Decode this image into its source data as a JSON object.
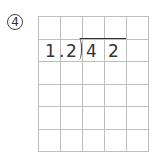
{
  "problem_label": "④",
  "grid": {
    "columns": 5,
    "rows": 6
  },
  "division": {
    "divisor": [
      "1",
      ".",
      "2"
    ],
    "dividend": [
      "4",
      "2"
    ]
  },
  "colors": {
    "grid_line": "#bdbdbd",
    "text": "#333333"
  }
}
